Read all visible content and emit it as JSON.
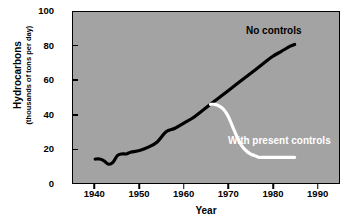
{
  "chart_data": {
    "type": "line",
    "title": "",
    "xlabel": "Year",
    "ylabel": "Hydrocarbons",
    "ylabel_sub": "(thousands of tons per day)",
    "xlim": [
      1935,
      1995
    ],
    "ylim": [
      0,
      100
    ],
    "xticks": [
      1940,
      1950,
      1960,
      1970,
      1980,
      1990
    ],
    "yticks": [
      0,
      20,
      40,
      60,
      80,
      100
    ],
    "xtick_labels": [
      "1940",
      "1950",
      "1960",
      "1970",
      "1980",
      "1990"
    ],
    "ytick_labels": [
      "0",
      "20",
      "40",
      "60",
      "80",
      "100"
    ],
    "grid": false,
    "legend_position": "inline-annotation",
    "plot_background": "#a3a3a3",
    "figure_background": "#ffffff",
    "series": [
      {
        "name": "No controls",
        "color": "#000000",
        "label_text": "No controls",
        "x": [
          1940,
          1941,
          1942,
          1943,
          1944,
          1945,
          1946,
          1947,
          1948,
          1950,
          1952,
          1954,
          1956,
          1958,
          1960,
          1962,
          1964,
          1966,
          1968,
          1970,
          1972,
          1974,
          1976,
          1978,
          1980,
          1982,
          1984,
          1985
        ],
        "values": [
          14,
          14,
          13,
          11,
          12,
          16,
          17,
          17,
          18,
          19,
          21,
          24,
          30,
          32,
          35,
          38,
          42,
          46,
          50,
          54,
          58,
          62,
          66,
          70,
          74,
          77,
          80,
          81
        ]
      },
      {
        "name": "With present controls",
        "color": "#ffffff",
        "label_text": "With present controls",
        "x": [
          1966,
          1967,
          1968,
          1969,
          1970,
          1971,
          1972,
          1973,
          1974,
          1975,
          1976,
          1977,
          1978,
          1980,
          1982,
          1984,
          1985
        ],
        "values": [
          46,
          46,
          45,
          43,
          39,
          33,
          27,
          22,
          19,
          17,
          16,
          15,
          15,
          15,
          15,
          15,
          15
        ]
      }
    ]
  },
  "axes": {
    "y_title": "Hydrocarbons",
    "y_subtitle": "(thousands of tons per day)",
    "x_title": "Year"
  },
  "labels": {
    "no_controls": "No controls",
    "with_present_controls": "With present controls"
  }
}
